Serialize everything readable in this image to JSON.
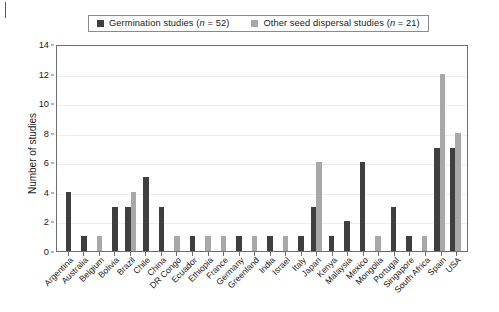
{
  "chart_data": {
    "type": "bar",
    "title": "",
    "xlabel": "",
    "ylabel": "Number of studies",
    "ylim": [
      0,
      14
    ],
    "ytick_step": 2,
    "yticks": [
      0,
      2,
      4,
      6,
      8,
      10,
      12,
      14
    ],
    "grid": true,
    "legend_position": "top",
    "categories": [
      "Argentina",
      "Australia",
      "Belgium",
      "Bolivia",
      "Brazil",
      "Chile",
      "China",
      "DR Congo",
      "Ecuador",
      "Ethiopia",
      "France",
      "Germany",
      "Greenland",
      "India",
      "Israel",
      "Italy",
      "Japan",
      "Kenya",
      "Malaysia",
      "Mexico",
      "Mongolia",
      "Portugal",
      "Singapore",
      "South Africa",
      "Spain",
      "USA"
    ],
    "series": [
      {
        "name": "Germination studies (n = 52)",
        "color": "#3f3f3f",
        "values": [
          4,
          1,
          0,
          3,
          3,
          5,
          3,
          0,
          1,
          0,
          0,
          1,
          0,
          1,
          0,
          1,
          3,
          1,
          2,
          6,
          0,
          3,
          1,
          0,
          7,
          7
        ]
      },
      {
        "name": "Other seed dispersal studies (n = 21)",
        "color": "#a8a8a8",
        "values": [
          0,
          0,
          1,
          0,
          4,
          0,
          0,
          1,
          0,
          1,
          1,
          0,
          1,
          0,
          1,
          0,
          6,
          0,
          0,
          0,
          1,
          0,
          0,
          1,
          12,
          8
        ]
      }
    ]
  },
  "legend": {
    "entries": [
      {
        "label_main": "Germination studies (",
        "label_italic": "n",
        "label_tail": " = 52)",
        "color": "#3f3f3f"
      },
      {
        "label_main": "Other seed dispersal studies (",
        "label_italic": "n",
        "label_tail": " = 21)",
        "color": "#a8a8a8"
      }
    ]
  }
}
